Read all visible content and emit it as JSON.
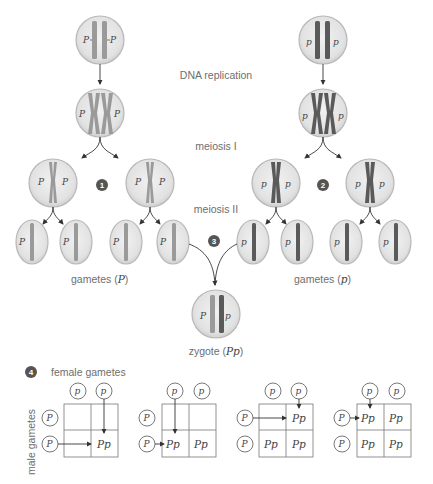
{
  "labels": {
    "dna_replication": "DNA replication",
    "meiosis_1": "meiosis I",
    "meiosis_2": "meiosis II",
    "gametes_P": "gametes (",
    "gametes_P_allele": "P",
    "gametes_p": "gametes (",
    "gametes_p_allele": "p",
    "zygote": "zygote (",
    "zygote_alleles": "Pp",
    "close_paren": ")",
    "female_gametes": "female gametes",
    "male_gametes": "male gametes"
  },
  "steps": [
    "1",
    "2",
    "3",
    "4"
  ],
  "alleles": {
    "dominant": "P",
    "recessive": "p",
    "heterozygote": "Pp"
  },
  "punnett_squares": [
    {
      "female": [
        "p",
        "p"
      ],
      "male": [
        "P",
        "P"
      ],
      "cells": [
        [
          "",
          ""
        ],
        [
          "",
          "Pp"
        ]
      ]
    },
    {
      "female": [
        "p",
        "p"
      ],
      "male": [
        "P",
        "P"
      ],
      "cells": [
        [
          "",
          ""
        ],
        [
          "Pp",
          "Pp"
        ]
      ]
    },
    {
      "female": [
        "p",
        "p"
      ],
      "male": [
        "P",
        "P"
      ],
      "cells": [
        [
          "",
          "Pp"
        ],
        [
          "Pp",
          "Pp"
        ]
      ]
    },
    {
      "female": [
        "p",
        "p"
      ],
      "male": [
        "P",
        "P"
      ],
      "cells": [
        [
          "Pp",
          "Pp"
        ],
        [
          "Pp",
          "Pp"
        ]
      ]
    }
  ],
  "colors": {
    "cell_fill": "#e6e6e6",
    "cell_stroke": "#b8b8b8",
    "chromosome_P": "#9a9a9a",
    "chromosome_p": "#5a5a5a",
    "label_text": "#6e6e6e"
  }
}
